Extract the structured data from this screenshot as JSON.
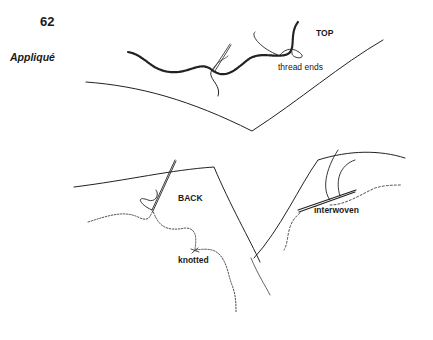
{
  "page": {
    "number": "62",
    "section_title": "Appliqué"
  },
  "figure": {
    "labels": {
      "top": "TOP",
      "thread_ends": "thread ends",
      "back": "BACK",
      "knotted": "knotted",
      "interwoven": "interwoven"
    }
  }
}
